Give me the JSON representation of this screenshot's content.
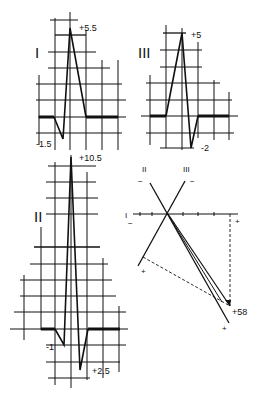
{
  "leads": {
    "I": {
      "label": "I",
      "peak_label": "+5.5",
      "trough_label": "-1.5"
    },
    "III": {
      "label": "III",
      "peak_label": "+5",
      "trough_label": "-2"
    },
    "II": {
      "label": "II",
      "peak_label": "+10.5",
      "q_label": "-1",
      "s_label": "+2.5"
    }
  },
  "axis_diagram": {
    "lead_I_label": "I",
    "lead_II_label": "II",
    "lead_III_label": "III",
    "minus": "−",
    "plus": "+",
    "result_label": "+58"
  },
  "colors": {
    "ink": "#111111",
    "background": "#ffffff"
  }
}
